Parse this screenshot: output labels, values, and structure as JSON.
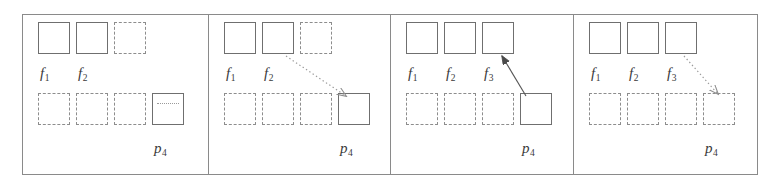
{
  "figure": {
    "type": "diagram",
    "frame_color": "#8a8a8a",
    "solid_box_color": "#6f6f6f",
    "dashed_box_color": "#8d8d8d",
    "dotted_arrow_color": "#9a9a9a",
    "solid_arrow_color": "#555555",
    "panels": [
      {
        "id": "panel-1",
        "index": 1,
        "top_row": [
          {
            "style": "solid",
            "label": "f",
            "sub": "1"
          },
          {
            "style": "solid",
            "label": "f",
            "sub": "2"
          },
          {
            "style": "dashed",
            "label": "",
            "sub": ""
          },
          {
            "style": "none",
            "label": "",
            "sub": ""
          }
        ],
        "bottom_row": [
          {
            "style": "dashed",
            "inner": "none",
            "label": "",
            "sub": ""
          },
          {
            "style": "dashed",
            "inner": "none",
            "label": "",
            "sub": ""
          },
          {
            "style": "dashed",
            "inner": "none",
            "label": "",
            "sub": ""
          },
          {
            "style": "solid",
            "inner": "dotted-line",
            "label": "p",
            "sub": "4"
          }
        ],
        "arrow": {
          "present": false,
          "style": "",
          "direction": ""
        }
      },
      {
        "id": "panel-2",
        "index": 2,
        "top_row": [
          {
            "style": "solid",
            "label": "f",
            "sub": "1"
          },
          {
            "style": "solid",
            "label": "f",
            "sub": "2"
          },
          {
            "style": "dashed",
            "label": "",
            "sub": ""
          },
          {
            "style": "none",
            "label": "",
            "sub": ""
          }
        ],
        "bottom_row": [
          {
            "style": "dashed",
            "inner": "none",
            "label": "",
            "sub": ""
          },
          {
            "style": "dashed",
            "inner": "none",
            "label": "",
            "sub": ""
          },
          {
            "style": "dashed",
            "inner": "none",
            "label": "",
            "sub": ""
          },
          {
            "style": "solid",
            "inner": "none",
            "label": "p",
            "sub": "4"
          }
        ],
        "arrow": {
          "present": true,
          "style": "dotted",
          "direction": "down-right",
          "from": "f2",
          "to": "p4"
        }
      },
      {
        "id": "panel-3",
        "index": 3,
        "top_row": [
          {
            "style": "solid",
            "label": "f",
            "sub": "1"
          },
          {
            "style": "solid",
            "label": "f",
            "sub": "2"
          },
          {
            "style": "solid",
            "label": "f",
            "sub": "3"
          },
          {
            "style": "none",
            "label": "",
            "sub": ""
          }
        ],
        "bottom_row": [
          {
            "style": "dashed",
            "inner": "none",
            "label": "",
            "sub": ""
          },
          {
            "style": "dashed",
            "inner": "none",
            "label": "",
            "sub": ""
          },
          {
            "style": "dashed",
            "inner": "none",
            "label": "",
            "sub": ""
          },
          {
            "style": "solid",
            "inner": "none",
            "label": "p",
            "sub": "4"
          }
        ],
        "arrow": {
          "present": true,
          "style": "solid",
          "direction": "up-left",
          "from": "p4",
          "to": "f3"
        }
      },
      {
        "id": "panel-4",
        "index": 4,
        "top_row": [
          {
            "style": "solid",
            "label": "f",
            "sub": "1"
          },
          {
            "style": "solid",
            "label": "f",
            "sub": "2"
          },
          {
            "style": "solid",
            "label": "f",
            "sub": "3"
          },
          {
            "style": "none",
            "label": "",
            "sub": ""
          }
        ],
        "bottom_row": [
          {
            "style": "dashed",
            "inner": "none",
            "label": "",
            "sub": ""
          },
          {
            "style": "dashed",
            "inner": "none",
            "label": "",
            "sub": ""
          },
          {
            "style": "dashed",
            "inner": "none",
            "label": "",
            "sub": ""
          },
          {
            "style": "dashed",
            "inner": "none",
            "label": "p",
            "sub": "4"
          }
        ],
        "arrow": {
          "present": true,
          "style": "dotted",
          "direction": "down-right",
          "from": "f3",
          "to": "p4"
        }
      }
    ]
  }
}
